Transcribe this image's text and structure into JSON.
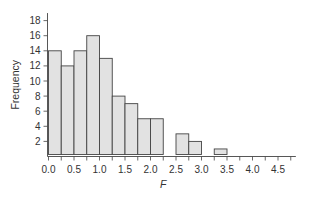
{
  "chart_data": {
    "type": "bar",
    "subtype": "histogram",
    "title": "",
    "xlabel": "F",
    "ylabel": "Frequency",
    "bin_width": 0.25,
    "bins": [
      {
        "start": 0.0,
        "end": 0.25,
        "value": 14
      },
      {
        "start": 0.25,
        "end": 0.5,
        "value": 12
      },
      {
        "start": 0.5,
        "end": 0.75,
        "value": 14
      },
      {
        "start": 0.75,
        "end": 1.0,
        "value": 16
      },
      {
        "start": 1.0,
        "end": 1.25,
        "value": 13
      },
      {
        "start": 1.25,
        "end": 1.5,
        "value": 8
      },
      {
        "start": 1.5,
        "end": 1.75,
        "value": 7
      },
      {
        "start": 1.75,
        "end": 2.0,
        "value": 5
      },
      {
        "start": 2.0,
        "end": 2.25,
        "value": 5
      },
      {
        "start": 2.25,
        "end": 2.5,
        "value": 0
      },
      {
        "start": 2.5,
        "end": 2.75,
        "value": 3
      },
      {
        "start": 2.75,
        "end": 3.0,
        "value": 2
      },
      {
        "start": 3.0,
        "end": 3.25,
        "value": 0
      },
      {
        "start": 3.25,
        "end": 3.5,
        "value": 1
      }
    ],
    "xlim": [
      0,
      4.85
    ],
    "ylim": [
      0,
      19
    ],
    "xticks": [
      "0.0",
      "0.5",
      "1.0",
      "1.5",
      "2.0",
      "2.5",
      "3.0",
      "3.5",
      "4.0",
      "4.5"
    ],
    "xtick_values": [
      0,
      0.5,
      1.0,
      1.5,
      2.0,
      2.5,
      3.0,
      3.5,
      4.0,
      4.5
    ],
    "x_minor_step": 0.25,
    "yticks": [
      "2",
      "4",
      "6",
      "8",
      "10",
      "12",
      "14",
      "16",
      "18"
    ],
    "ytick_values": [
      2,
      4,
      6,
      8,
      10,
      12,
      14,
      16,
      18
    ],
    "grid": false,
    "legend": "none",
    "colors": {
      "bar_fill": "#e2e2e2",
      "bar_stroke": "#444444",
      "axis": "#444444",
      "text": "#333333"
    }
  }
}
